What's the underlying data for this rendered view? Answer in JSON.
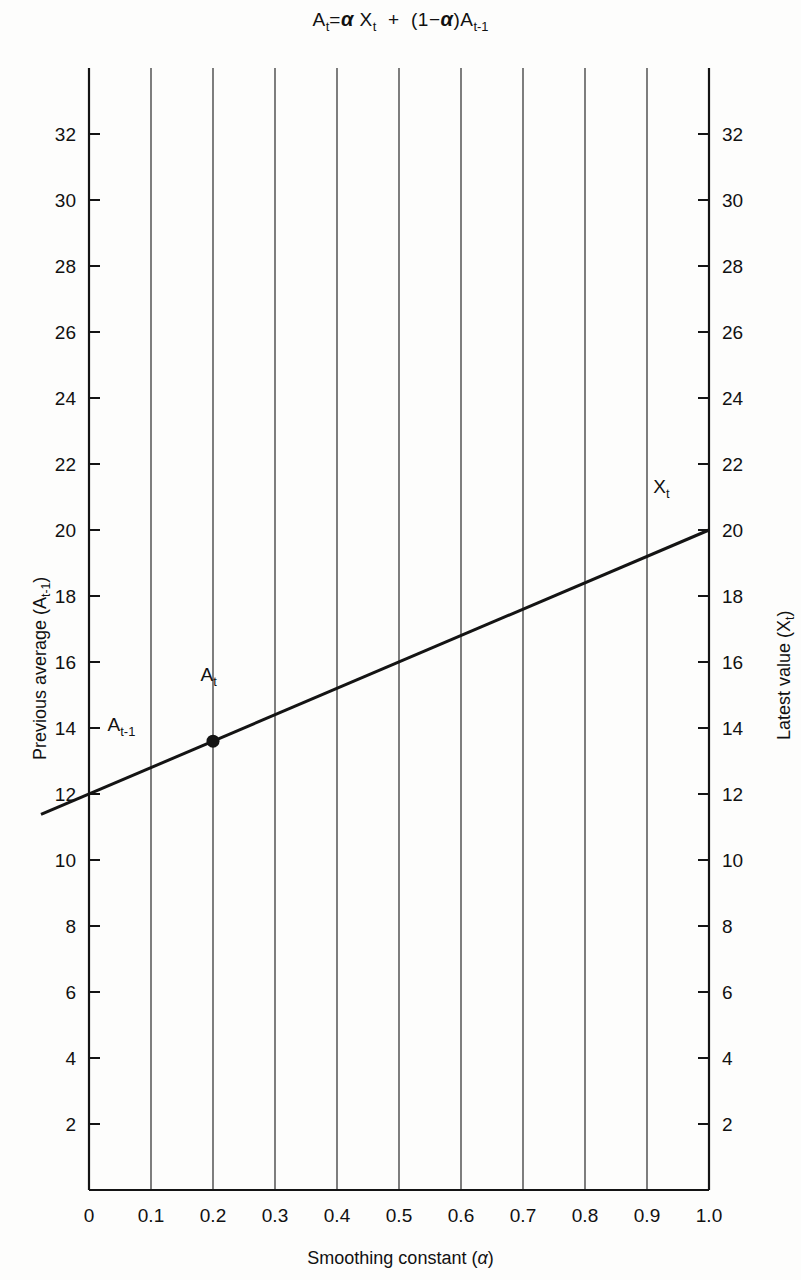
{
  "figure": {
    "title_parts": {
      "a_t": "A",
      "t_sub": "t",
      "equals": "=",
      "alpha": "α",
      "x": "X",
      "plus": "+",
      "open_paren": "(",
      "one": "1",
      "minus": "−",
      "close_paren": ")",
      "t_minus_1_sub": "t-1"
    },
    "title_text": "Aₜ = α Xₜ + (1−α)Aₜ₋₁"
  },
  "axes": {
    "x": {
      "label_text": "Smoothing constant (",
      "label_symbol": "α",
      "label_close": ")",
      "ticks": [
        "0",
        "0.1",
        "0.2",
        "0.3",
        "0.4",
        "0.5",
        "0.6",
        "0.7",
        "0.8",
        "0.9",
        "1.0"
      ],
      "tick_values": [
        0,
        0.1,
        0.2,
        0.3,
        0.4,
        0.5,
        0.6,
        0.7,
        0.8,
        0.9,
        1.0
      ],
      "range": [
        0,
        1.0
      ]
    },
    "y_left": {
      "label_text": "Previous average (A",
      "label_sub": "t-1",
      "label_close": ")",
      "ticks": [
        "2",
        "4",
        "6",
        "8",
        "10",
        "12",
        "14",
        "16",
        "18",
        "20",
        "22",
        "24",
        "26",
        "28",
        "30",
        "32"
      ],
      "tick_values": [
        2,
        4,
        6,
        8,
        10,
        12,
        14,
        16,
        18,
        20,
        22,
        24,
        26,
        28,
        30,
        32
      ],
      "range": [
        0,
        34
      ]
    },
    "y_right": {
      "label_text": "Latest value (X",
      "label_sub": "t",
      "label_close": ")",
      "ticks": [
        "2",
        "4",
        "6",
        "8",
        "10",
        "12",
        "14",
        "16",
        "18",
        "20",
        "22",
        "24",
        "26",
        "28",
        "30",
        "32"
      ],
      "tick_values": [
        2,
        4,
        6,
        8,
        10,
        12,
        14,
        16,
        18,
        20,
        22,
        24,
        26,
        28,
        30,
        32
      ],
      "range": [
        0,
        34
      ]
    }
  },
  "annotations": [
    {
      "name": "a-t-minus-1",
      "text": "A",
      "sub": "t-1",
      "x": 0.03,
      "y": 14.1
    },
    {
      "name": "a-t",
      "text": "A",
      "sub": "t",
      "x": 0.18,
      "y": 15.6
    },
    {
      "name": "x-t",
      "text": "X",
      "sub": "t",
      "x": 0.91,
      "y": 21.3
    }
  ],
  "style": {
    "ink": "#141414",
    "background": "#fdfdfc",
    "gridline": "#3a3a3a"
  },
  "chart_data": {
    "type": "line",
    "xlabel": "Smoothing constant (α)",
    "ylabel": "Previous average (Aₜ₋₁)",
    "ylabel_right": "Latest value (Xₜ)",
    "xlim": [
      0,
      1.0
    ],
    "ylim": [
      0,
      34
    ],
    "grid": "vertical-only",
    "legend": "none",
    "series": [
      {
        "name": "A_t = αX_t + (1-α)A_{t-1}",
        "x": [
          0.0,
          0.1,
          0.2,
          0.3,
          0.4,
          0.5,
          0.6,
          0.7,
          0.8,
          0.9,
          1.0
        ],
        "values": [
          12.0,
          12.8,
          13.6,
          14.4,
          15.2,
          16.0,
          16.8,
          17.6,
          18.4,
          19.2,
          20.0
        ],
        "line_extends_left_of_axis": true
      }
    ],
    "points": [
      {
        "label": "A_t",
        "x": 0.2,
        "y": 13.6,
        "marker": "filled-circle"
      }
    ],
    "endpoints": {
      "A_t_minus_1": {
        "x": 0.0,
        "y": 12.0
      },
      "X_t": {
        "x": 1.0,
        "y": 20.0
      }
    }
  }
}
